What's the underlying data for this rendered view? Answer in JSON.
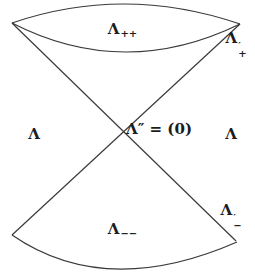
{
  "figure": {
    "background": "#ffffff",
    "line_color": "#3a3a3a",
    "text_color": "#1c1c1c",
    "labels": {
      "top": {
        "base": "Λ",
        "sub": "++"
      },
      "upper_right": {
        "base": "Λ",
        "prime": "′",
        "sign": "+"
      },
      "left": {
        "base": "Λ"
      },
      "center": {
        "text": "Λ″ = (0)"
      },
      "right": {
        "base": "Λ"
      },
      "lower_right": {
        "base": "Λ",
        "prime": "′",
        "sign": "−"
      },
      "bottom": {
        "base": "Λ",
        "sub": "−−"
      }
    }
  }
}
